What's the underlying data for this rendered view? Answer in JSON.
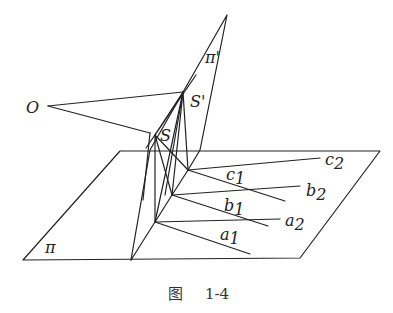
{
  "figure": {
    "caption_prefix": "图",
    "caption_number": "1-4",
    "line_color": "#222222",
    "points": {
      "O": "O",
      "S": "S",
      "S_prime": "S'"
    },
    "planes": {
      "pi": "π",
      "pi_prime": "π'"
    },
    "lines": {
      "a1": {
        "base": "a",
        "sub": "1"
      },
      "a2": {
        "base": "a",
        "sub": "2"
      },
      "b1": {
        "base": "b",
        "sub": "1"
      },
      "b2": {
        "base": "b",
        "sub": "2"
      },
      "c1": {
        "base": "c",
        "sub": "1"
      },
      "c2": {
        "base": "c",
        "sub": "2"
      }
    }
  }
}
